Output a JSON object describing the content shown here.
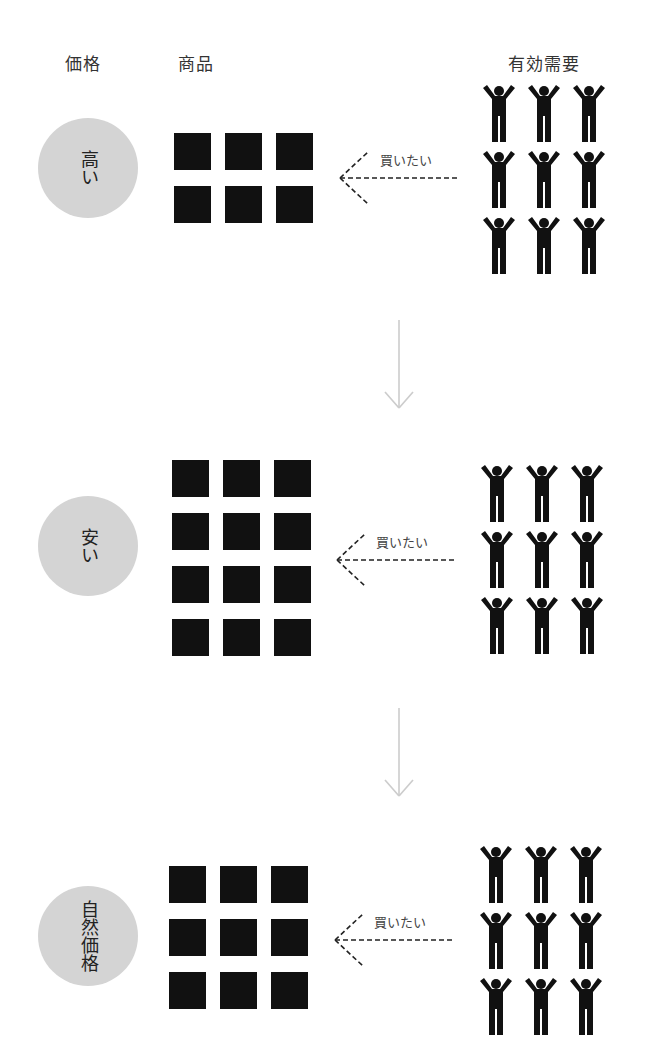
{
  "headers": {
    "price": "価格",
    "goods": "商品",
    "effective_demand": "有効需要"
  },
  "buy_label": "買いたい",
  "colors": {
    "circle": "#d4d4d4",
    "square": "#111111",
    "person": "#111111",
    "down_arrow": "#cccccc",
    "dashed_arrow": "#222222"
  },
  "sections": [
    {
      "price_label": "高い",
      "goods_rows": 2,
      "goods_cols": 3,
      "goods_count": 6,
      "demand_count": 9
    },
    {
      "price_label": "安い",
      "goods_rows": 4,
      "goods_cols": 3,
      "goods_count": 12,
      "demand_count": 9
    },
    {
      "price_label": "自然価格",
      "goods_rows": 3,
      "goods_cols": 3,
      "goods_count": 9,
      "demand_count": 9
    }
  ]
}
